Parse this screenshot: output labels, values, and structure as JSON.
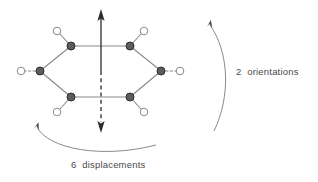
{
  "figure": {
    "background_color": "#ffffff",
    "line_color": "#8a8a8a",
    "axis_color": "#2b2b2b",
    "vertex_fill": "#595959",
    "vertex_stroke": "#2b2b2b",
    "substituent_fill": "#ffffff",
    "substituent_stroke": "#8a8a8a",
    "text_color": "#4a4a4a"
  },
  "labels": {
    "orientations": "2  orientations",
    "displacements": "6  displacements"
  },
  "molecule": {
    "ring_name": "hexagonal-ring",
    "vertex_count": 6,
    "vertices": [
      {
        "id": "vertex-top-left",
        "x": 71,
        "y": 46
      },
      {
        "id": "vertex-top-right",
        "x": 130,
        "y": 46
      },
      {
        "id": "vertex-right",
        "x": 161,
        "y": 71
      },
      {
        "id": "vertex-bottom-right",
        "x": 130,
        "y": 97
      },
      {
        "id": "vertex-bottom-left",
        "x": 71,
        "y": 97
      },
      {
        "id": "vertex-left",
        "x": 40,
        "y": 71
      }
    ],
    "substituents": [
      {
        "id": "substituent-top-left",
        "x": 58,
        "y": 32,
        "dashed": false
      },
      {
        "id": "substituent-top-right",
        "x": 143,
        "y": 32,
        "dashed": false
      },
      {
        "id": "substituent-right",
        "x": 180,
        "y": 71,
        "dashed": true
      },
      {
        "id": "substituent-bottom-right",
        "x": 143,
        "y": 111,
        "dashed": false
      },
      {
        "id": "substituent-bottom-left",
        "x": 58,
        "y": 111,
        "dashed": false
      },
      {
        "id": "substituent-left",
        "x": 21,
        "y": 71,
        "dashed": true
      }
    ],
    "vertex_radius": 4,
    "substituent_radius": 4
  },
  "axis": {
    "name": "vertical-c2-axis",
    "x": 101,
    "top_y": 10,
    "bottom_y": 133,
    "center_y": 71,
    "upper_style": "solid",
    "lower_style": "dashed",
    "has_up_arrow": true,
    "has_down_arrow": true
  },
  "arcs": {
    "orientations_arc": {
      "name": "orientations-rotation-arrow",
      "path": "M 209,23 C 228,50 231,95 214,131",
      "arrow_at": "start",
      "direction": "counterclockwise"
    },
    "displacements_arc": {
      "name": "displacements-rotation-arrow",
      "path": "M 36,125 C 46,148 100,158 155,144",
      "arrow_at": "start",
      "direction": "clockwise"
    }
  }
}
